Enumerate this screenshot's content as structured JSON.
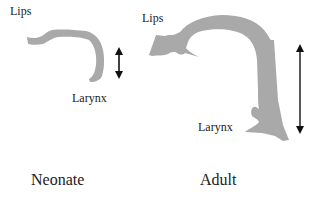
{
  "labels": {
    "neonate_lips": "Lips",
    "neonate_larynx": "Larynx",
    "adult_lips": "Lips",
    "adult_larynx": "Larynx",
    "neonate_caption": "Neonate",
    "adult_caption": "Adult"
  },
  "colors": {
    "tract_fill": "#a9a9a9",
    "arrow": "#111111",
    "text": "#222222"
  }
}
